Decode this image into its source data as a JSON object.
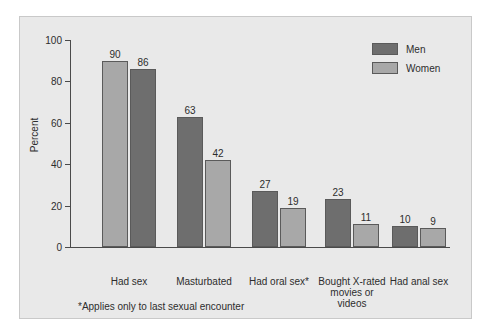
{
  "chart_data": {
    "type": "bar",
    "title": "",
    "xlabel": "",
    "ylabel": "Percent",
    "ylim": [
      0,
      100
    ],
    "yticks": [
      0,
      20,
      40,
      60,
      80,
      100
    ],
    "grid": false,
    "legend_position": "top-right",
    "categories": [
      "Had sex",
      "Masturbated",
      "Had oral sex*",
      "Bought X-rated movies or videos",
      "Had anal sex"
    ],
    "category_lines": [
      [
        "Had sex"
      ],
      [
        "Masturbated"
      ],
      [
        "Had oral sex*"
      ],
      [
        "Bought X-rated",
        "movies or",
        "videos"
      ],
      [
        "Had anal sex"
      ]
    ],
    "series": [
      {
        "name": "Men",
        "color": "#6e6e6e",
        "values": [
          90,
          63,
          27,
          23,
          10
        ]
      },
      {
        "name": "Women",
        "color": "#a8a8a8",
        "values": [
          86,
          42,
          19,
          11,
          9
        ]
      }
    ],
    "bar_order": [
      "women-first",
      "men-first",
      "men-first",
      "men-first",
      "men-first"
    ],
    "annotations": [
      "*Applies only to last sexual encounter"
    ]
  },
  "axis": {
    "y_title": "Percent",
    "y_tick_labels": [
      "0",
      "20",
      "40",
      "60",
      "80",
      "100"
    ]
  },
  "legend": {
    "entries": [
      {
        "label": "Men",
        "key": "men"
      },
      {
        "label": "Women",
        "key": "women"
      }
    ]
  },
  "bars": [
    {
      "group": 0,
      "left": {
        "series": "Women",
        "value": "86",
        "cls": "women"
      },
      "right": {
        "series": "Men",
        "value": "90",
        "cls": "men"
      }
    }
  ],
  "footnote": "*Applies only to last sexual encounter"
}
